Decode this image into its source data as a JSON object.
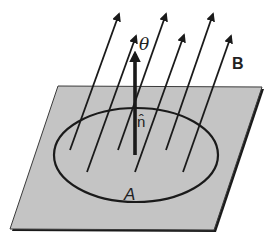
{
  "diagram": {
    "labels": {
      "theta": "θ",
      "field": "B",
      "normal": "n̂",
      "area": "A"
    },
    "colors": {
      "plane_fill": "#c4c4c4",
      "stroke": "#1a1a1a",
      "background": "#ffffff"
    },
    "plane": {
      "corners": [
        [
          58,
          86
        ],
        [
          262,
          87
        ],
        [
          214,
          230
        ],
        [
          10,
          229
        ]
      ]
    },
    "loop": {
      "cx": 136,
      "cy": 155,
      "rx": 82,
      "ry": 47
    },
    "normal_vector": {
      "from": [
        135,
        155
      ],
      "to": [
        135,
        52
      ]
    },
    "field_lines": [
      {
        "from": [
          70,
          150
        ],
        "to": [
          119,
          14
        ]
      },
      {
        "from": [
          87,
          172
        ],
        "to": [
          136,
          36
        ]
      },
      {
        "from": [
          118,
          150
        ],
        "to": [
          166,
          14
        ]
      },
      {
        "from": [
          135,
          172
        ],
        "to": [
          184,
          35
        ]
      },
      {
        "from": [
          166,
          150
        ],
        "to": [
          213,
          14
        ]
      },
      {
        "from": [
          183,
          172
        ],
        "to": [
          231,
          36
        ]
      }
    ]
  }
}
